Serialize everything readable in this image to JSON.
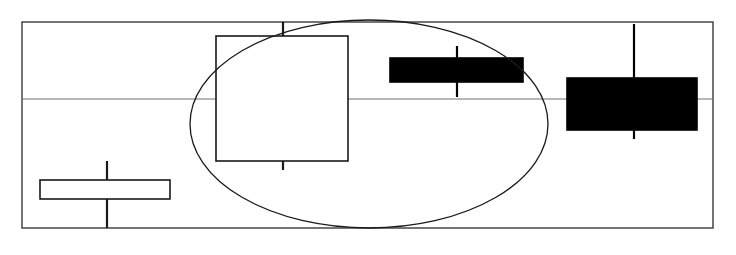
{
  "chart_data": {
    "type": "candlestick",
    "title": "",
    "subtitle": "",
    "xlabel": "",
    "ylabel": "",
    "grid": true,
    "legend": null,
    "legend_position": "none",
    "axis_ranges": {
      "x_px": [
        22,
        713
      ],
      "y_px": [
        22,
        228
      ]
    },
    "gridlines": {
      "horizontal_px": [
        99
      ],
      "vertical_px": []
    },
    "categories": [
      "1",
      "2",
      "3",
      "4"
    ],
    "candles": [
      {
        "index": 1,
        "label": "1",
        "direction": "bullish",
        "fill": "#ffffff",
        "stroke": "#1a1a1a",
        "body_left_px": 40,
        "body_right_px": 170,
        "body_top_px": 180,
        "body_bottom_px": 199,
        "wick_x_px": 107,
        "wick_top_px": 161,
        "wick_bottom_px": 228
      },
      {
        "index": 2,
        "label": "2",
        "direction": "bullish",
        "fill": "#ffffff",
        "stroke": "#1a1a1a",
        "body_left_px": 216,
        "body_right_px": 348,
        "body_top_px": 36,
        "body_bottom_px": 161,
        "wick_x_px": 283,
        "wick_top_px": 22,
        "wick_bottom_px": 170
      },
      {
        "index": 3,
        "label": "3",
        "direction": "bearish",
        "fill": "#000000",
        "stroke": "#000000",
        "body_left_px": 390,
        "body_right_px": 523,
        "body_top_px": 58,
        "body_bottom_px": 82,
        "wick_x_px": 457,
        "wick_top_px": 46,
        "wick_bottom_px": 97
      },
      {
        "index": 4,
        "label": "4",
        "direction": "bearish",
        "fill": "#000000",
        "stroke": "#000000",
        "body_left_px": 567,
        "body_right_px": 697,
        "body_top_px": 78,
        "body_bottom_px": 130,
        "wick_x_px": 634,
        "wick_top_px": 24,
        "wick_bottom_px": 139
      }
    ],
    "annotations": [
      {
        "kind": "ellipse",
        "name": "highlight-ellipse",
        "cx_px": 369,
        "cy_px": 124,
        "rx_px": 179,
        "ry_px": 104,
        "stroke": "#1a1a1a",
        "fill": "none"
      }
    ]
  },
  "style": {
    "frame_stroke": "#3a3a3a",
    "grid_stroke": "#6e6e6e",
    "background": "#ffffff",
    "candle_line_width": 1.6,
    "frame_line_width": 1.4,
    "grid_line_width": 1.0,
    "annotation_line_width": 1.3
  }
}
